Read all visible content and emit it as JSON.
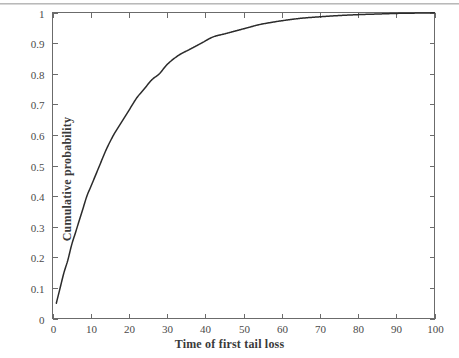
{
  "chart_data": {
    "type": "line",
    "title": "",
    "xlabel": "Time of first tail loss",
    "ylabel": "Cumulative probability",
    "xlim": [
      0,
      100
    ],
    "ylim": [
      0,
      1
    ],
    "grid": false,
    "legend": null,
    "xticks": [
      "0",
      "10",
      "20",
      "30",
      "40",
      "50",
      "60",
      "70",
      "80",
      "90",
      "100"
    ],
    "xtick_values": [
      0,
      10,
      20,
      30,
      40,
      50,
      60,
      70,
      80,
      90,
      100
    ],
    "yticks": [
      "0",
      "0.1",
      "0.2",
      "0.3",
      "0.4",
      "0.5",
      "0.6",
      "0.7",
      "0.8",
      "0.9",
      "1"
    ],
    "ytick_values": [
      0,
      0.1,
      0.2,
      0.3,
      0.4,
      0.5,
      0.6,
      0.7,
      0.8,
      0.9,
      1
    ],
    "line_color": "#2b2b2b",
    "axis_color": "#6b6b6b",
    "series": [
      {
        "name": "Cumulative probability of first tail loss",
        "x": [
          1,
          2,
          3,
          4,
          5,
          6,
          7,
          8,
          9,
          10,
          12,
          14,
          16,
          18,
          20,
          22,
          24,
          26,
          28,
          30,
          33,
          36,
          39,
          42,
          45,
          48,
          51,
          54,
          57,
          60,
          65,
          70,
          75,
          80,
          85,
          90,
          95,
          100
        ],
        "y": [
          0.05,
          0.1,
          0.15,
          0.19,
          0.24,
          0.28,
          0.32,
          0.36,
          0.4,
          0.43,
          0.49,
          0.55,
          0.6,
          0.64,
          0.68,
          0.72,
          0.75,
          0.78,
          0.8,
          0.83,
          0.86,
          0.88,
          0.9,
          0.92,
          0.93,
          0.94,
          0.95,
          0.96,
          0.967,
          0.973,
          0.981,
          0.986,
          0.99,
          0.993,
          0.995,
          0.997,
          0.998,
          0.999
        ]
      }
    ]
  },
  "axes": {
    "x_title": "Time of first tail loss",
    "y_title": "Cumulative probability"
  }
}
